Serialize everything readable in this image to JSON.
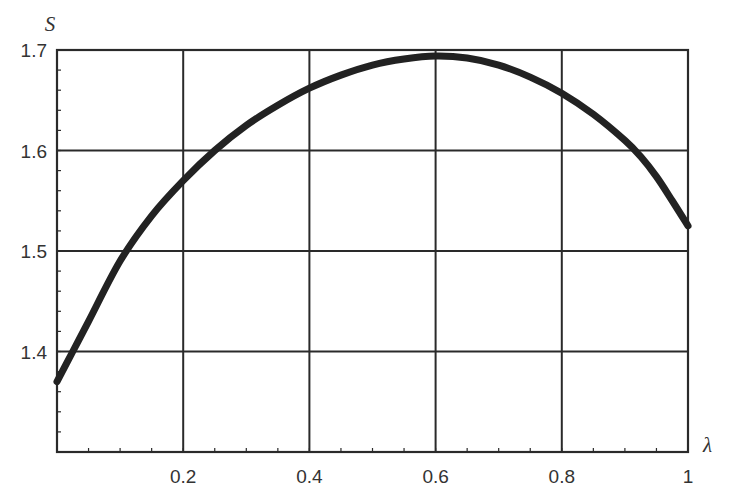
{
  "chart_data": {
    "type": "line",
    "title": "",
    "xlabel": "λ",
    "ylabel": "S",
    "xlim": [
      0,
      1
    ],
    "ylim": [
      1.3,
      1.7
    ],
    "grid": true,
    "legend": null,
    "x_ticks": [
      0.2,
      0.4,
      0.6,
      0.8,
      1
    ],
    "x_tick_labels": [
      "0.2",
      "0.4",
      "0.6",
      "0.8",
      "1"
    ],
    "y_ticks": [
      1.4,
      1.5,
      1.6,
      1.7
    ],
    "y_tick_labels": [
      "1.4",
      "1.5",
      "1.6",
      "1.7"
    ],
    "series": [
      {
        "name": "S(λ)",
        "color": "#222222",
        "x": [
          0.0,
          0.025,
          0.05,
          0.1,
          0.15,
          0.2,
          0.25,
          0.3,
          0.35,
          0.4,
          0.45,
          0.5,
          0.55,
          0.6,
          0.65,
          0.7,
          0.75,
          0.8,
          0.85,
          0.9,
          0.925,
          0.95,
          0.975,
          1.0
        ],
        "values": [
          1.37,
          1.4,
          1.43,
          1.49,
          1.535,
          1.57,
          1.6,
          1.625,
          1.645,
          1.662,
          1.675,
          1.685,
          1.691,
          1.694,
          1.692,
          1.685,
          1.673,
          1.657,
          1.636,
          1.61,
          1.594,
          1.574,
          1.55,
          1.525
        ]
      }
    ]
  }
}
